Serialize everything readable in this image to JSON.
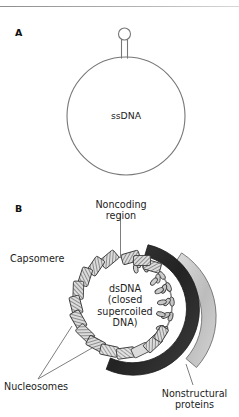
{
  "figure": {
    "panels": [
      {
        "letter": "A",
        "type": "ssDNA circular genome with hairpin",
        "center_label": "ssDNA"
      },
      {
        "letter": "B",
        "type": "dsDNA circular genome with nucleosomes and protein arcs",
        "center_label_lines": [
          "dsDNA",
          "(closed",
          "supercoiled",
          "DNA)"
        ],
        "callouts": [
          {
            "id": "noncoding",
            "label_lines": [
              "Noncoding",
              "region"
            ]
          },
          {
            "id": "capsomere",
            "label": "Capsomere"
          },
          {
            "id": "nucleosomes",
            "label": "Nucleosomes"
          },
          {
            "id": "nonstructural",
            "label_lines": [
              "Nonstructural",
              "proteins"
            ]
          }
        ]
      }
    ],
    "colors": {
      "outline": "#6b6b6b",
      "text": "#1c1c1c",
      "dark_arc": "#2e2e2e",
      "light_arc": "#c8c8c8",
      "nucleosome_fill": "#d9d9d9",
      "rule": "#9a9a9a"
    }
  }
}
